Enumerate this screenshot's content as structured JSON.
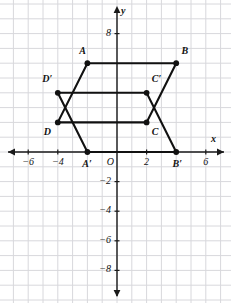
{
  "figure": {
    "axis_labels": {
      "x": "x",
      "y": "y",
      "origin": "O"
    },
    "grid_color": "#d8d8dc",
    "axis_color": "#1a1a1a",
    "shape_color": "#111111"
  },
  "chart_data": {
    "type": "scatter",
    "title": "",
    "xlabel": "x",
    "ylabel": "y",
    "xlim": [
      -7.8,
      7.5
    ],
    "ylim": [
      -9.5,
      9.3
    ],
    "grid": true,
    "legend": "none",
    "x_ticks": [
      -6,
      -4,
      2,
      6
    ],
    "x_tick_labels": [
      "−6",
      "−4",
      "2",
      "6"
    ],
    "y_ticks": [
      8,
      -2,
      -4,
      -6,
      -8
    ],
    "y_tick_labels": [
      "8",
      "−2",
      "−4",
      "−6",
      "−8"
    ],
    "origin_label": "O",
    "points": [
      {
        "name": "A",
        "label": "A",
        "x": -2,
        "y": 6
      },
      {
        "name": "B",
        "label": "B",
        "x": 4,
        "y": 6
      },
      {
        "name": "C",
        "label": "C",
        "x": 2,
        "y": 2
      },
      {
        "name": "D",
        "label": "D",
        "x": -4,
        "y": 2
      },
      {
        "name": "Ap",
        "label": "A′",
        "x": -2,
        "y": 0
      },
      {
        "name": "Bp",
        "label": "B′",
        "x": 4,
        "y": 0
      },
      {
        "name": "Cp",
        "label": "C′",
        "x": 2,
        "y": 4
      },
      {
        "name": "Dp",
        "label": "D′",
        "x": -4,
        "y": 4
      }
    ],
    "polygons": [
      {
        "name": "ABCD",
        "vertices": [
          "A",
          "B",
          "C",
          "D"
        ]
      },
      {
        "name": "ApBpCpDp",
        "vertices": [
          "Ap",
          "Bp",
          "Cp",
          "Dp"
        ]
      }
    ],
    "annotations": [
      {
        "text": "A",
        "x": -2.55,
        "y": 6.75
      },
      {
        "text": "B",
        "x": 4.35,
        "y": 6.75
      },
      {
        "text": "C",
        "x": 2.35,
        "y": 1.3
      },
      {
        "text": "D",
        "x": -4.95,
        "y": 1.3
      },
      {
        "text": "A′",
        "x": -2.35,
        "y": -0.85
      },
      {
        "text": "B′",
        "x": 3.75,
        "y": -0.85
      },
      {
        "text": "C′",
        "x": 2.35,
        "y": 4.85
      },
      {
        "text": "D′",
        "x": -5.05,
        "y": 4.85
      }
    ]
  }
}
